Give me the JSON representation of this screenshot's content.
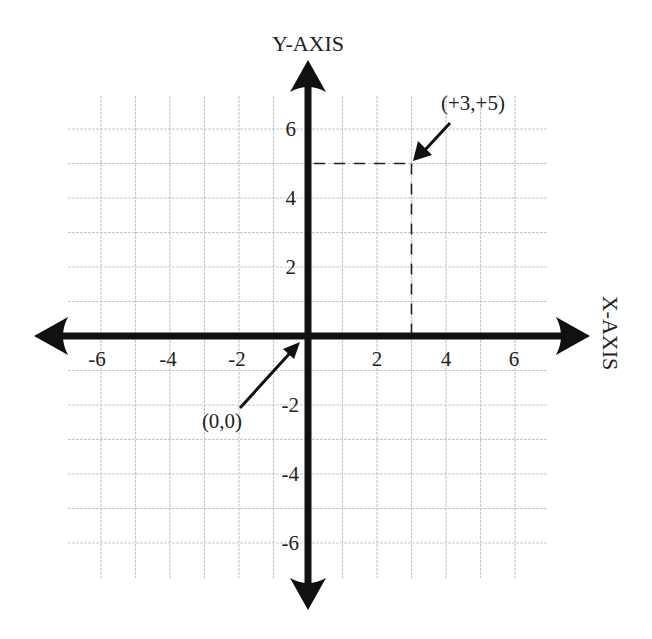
{
  "diagram": {
    "type": "cartesian-coordinate-plane",
    "y_axis_label": "Y-AXIS",
    "x_axis_label": "X-AXIS",
    "x_tick_labels": [
      "-6",
      "-4",
      "-2",
      "2",
      "4",
      "6"
    ],
    "y_tick_labels": [
      "6",
      "4",
      "2",
      "-2",
      "-4",
      "-6"
    ],
    "grid": {
      "x_range": [
        -6,
        6
      ],
      "y_range": [
        -7,
        7
      ],
      "step": 1
    },
    "annotations": [
      {
        "label": "(+3,+5)",
        "points_to": {
          "x": 3,
          "y": 5
        }
      },
      {
        "label": "(0,0)",
        "points_to": {
          "x": 0,
          "y": 0
        }
      }
    ],
    "highlighted_point": {
      "x": 3,
      "y": 5,
      "guides": "dashed lines to both axes"
    },
    "colors": {
      "axis": "#111111",
      "grid": "#c9c9c9",
      "text": "#222222",
      "background": "#ffffff"
    }
  }
}
